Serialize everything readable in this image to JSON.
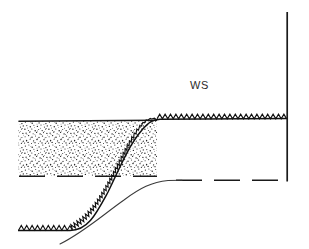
{
  "figure": {
    "kind": "hydraulic-cross-section-schematic",
    "width": 309,
    "height": 249,
    "background_color": "#ffffff",
    "ink_color": "#1a1a1a",
    "stipple_color": "#2a2a2a",
    "annotations": [
      {
        "id": "ws",
        "text": "WS",
        "x": 190,
        "y": 79,
        "font_size": 11,
        "color": "#2b2b2b"
      }
    ],
    "elements": {
      "sediment_layer": {
        "label": "stippled sediment deposit",
        "x_start": 18,
        "x_end": 157,
        "y_top": 121,
        "y_bottom": 176,
        "fill_pattern": "stipple",
        "top_edge_style": "solid",
        "bottom_edge_style": "dashed"
      },
      "upper_bed_line": {
        "label": "upper bed surface with sawtooth hatching",
        "y": 119,
        "x_start": 157,
        "x_end": 287,
        "hatch": "sawtooth",
        "tooth_height": 5,
        "tooth_width": 5.4
      },
      "lower_bed_line": {
        "label": "lower bed surface with sawtooth hatching",
        "y": 230,
        "x_start": 18,
        "x_end": 72,
        "hatch": "sawtooth",
        "tooth_height": 5,
        "tooth_width": 5.4
      },
      "scour_face": {
        "label": "S-shaped scour face with sawtooth hatching",
        "from": [
          72,
          230
        ],
        "to": [
          157,
          119
        ],
        "hatch": "sawtooth"
      },
      "secondary_curve": {
        "label": "secondary water-surface profile curve",
        "from": [
          62,
          243
        ],
        "to": [
          180,
          180
        ],
        "style": "thin-solid"
      },
      "right_dashed_line": {
        "label": "downstream dashed datum line",
        "y": 180,
        "x_start": 176,
        "x_end": 287,
        "style": "dashed"
      },
      "right_vertical_wall": {
        "label": "downstream vertical boundary wall",
        "x": 287,
        "y_top": 12,
        "y_bottom": 181,
        "style": "solid"
      }
    }
  }
}
